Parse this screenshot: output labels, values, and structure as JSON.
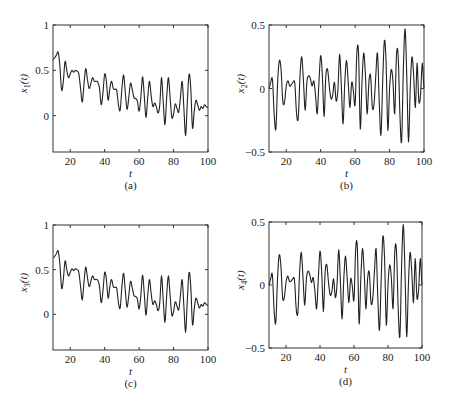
{
  "chart_data": [
    {
      "type": "line",
      "panel": "a",
      "caption": "(a)",
      "xlabel": "t",
      "ylabel": "x1(t)",
      "ylabel_main": "x",
      "ylabel_sub": "1",
      "ylabel_tail": "(t)",
      "xlim": [
        10,
        100
      ],
      "ylim": [
        -0.4,
        1
      ],
      "xticks": [
        20,
        40,
        60,
        80,
        100
      ],
      "yticks": [
        0,
        0.5,
        1
      ],
      "ytick_labels": [
        "0",
        "0.5",
        "1"
      ],
      "grid": false,
      "box": {
        "left": 53,
        "top": 25,
        "right": 208,
        "bottom": 152
      },
      "series": [
        {
          "name": "x1(t)",
          "x": [
            10,
            11,
            12,
            13,
            14,
            15,
            16,
            17,
            18,
            19,
            20,
            21,
            22,
            23,
            24,
            25,
            26,
            27,
            28,
            29,
            30,
            31,
            32,
            33,
            34,
            35,
            36,
            37,
            38,
            39,
            40,
            41,
            42,
            43,
            44,
            45,
            46,
            47,
            48,
            49,
            50,
            51,
            52,
            53,
            54,
            55,
            56,
            57,
            58,
            59,
            60,
            61,
            62,
            63,
            64,
            65,
            66,
            67,
            68,
            69,
            70,
            71,
            72,
            73,
            74,
            75,
            76,
            77,
            78,
            79,
            80,
            81,
            82,
            83,
            84,
            85,
            86,
            87,
            88,
            89,
            90,
            91,
            92,
            93,
            94,
            95,
            96,
            97,
            98,
            99,
            100
          ],
          "values": [
            0.62,
            0.64,
            0.67,
            0.7,
            0.55,
            0.28,
            0.38,
            0.6,
            0.5,
            0.42,
            0.46,
            0.5,
            0.48,
            0.5,
            0.49,
            0.46,
            0.3,
            0.15,
            0.35,
            0.52,
            0.4,
            0.3,
            0.36,
            0.42,
            0.38,
            0.38,
            0.37,
            0.3,
            0.12,
            0.25,
            0.46,
            0.38,
            0.17,
            0.3,
            0.38,
            0.3,
            0.29,
            0.28,
            0.12,
            0.06,
            0.3,
            0.45,
            0.25,
            0.07,
            0.2,
            0.36,
            0.29,
            0.2,
            0.19,
            0.16,
            0.05,
            0.2,
            0.43,
            0.22,
            -0.02,
            0.2,
            0.38,
            0.22,
            0.1,
            0.14,
            0.1,
            0.03,
            0.12,
            0.42,
            0.15,
            -0.1,
            0.2,
            0.42,
            0.2,
            -0.02,
            0.02,
            0.13,
            0.08,
            0.04,
            0.2,
            0.38,
            0.08,
            -0.22,
            0.15,
            0.46,
            0.3,
            -0.14,
            0.05,
            0.17,
            0.12,
            0.06,
            0.1,
            0.08,
            0.12,
            0.1,
            0.09
          ],
          "color": "#222222"
        }
      ]
    },
    {
      "type": "line",
      "panel": "b",
      "caption": "(b)",
      "xlabel": "t",
      "ylabel": "x2(t)",
      "ylabel_main": "x",
      "ylabel_sub": "2",
      "ylabel_tail": "(t)",
      "xlim": [
        10,
        100
      ],
      "ylim": [
        -0.5,
        0.5
      ],
      "xticks": [
        20,
        40,
        60,
        80,
        100
      ],
      "yticks": [
        -0.5,
        0,
        0.5
      ],
      "ytick_labels": [
        "−0.5",
        "0",
        "0.5"
      ],
      "grid": false,
      "box": {
        "left": 269,
        "top": 25,
        "right": 424,
        "bottom": 152
      },
      "series": [
        {
          "name": "x2(t)",
          "values": [
            0,
            0.05,
            0.07,
            -0.2,
            -0.32,
            0.05,
            0.22,
            0.15,
            -0.1,
            -0.11,
            0.02,
            0.06,
            0.02,
            0.03,
            0.05,
            0.04,
            -0.2,
            -0.23,
            0.1,
            0.25,
            0.06,
            -0.17,
            0.05,
            0.1,
            0.08,
            0.02,
            0.06,
            -0.05,
            -0.2,
            0.05,
            0.26,
            0.1,
            -0.22,
            0.1,
            0.15,
            0.02,
            -0.08,
            -0.05,
            0.05,
            -0.1,
            -0.01,
            0.27,
            0.02,
            -0.28,
            0.05,
            0.22,
            0.05,
            -0.15,
            0.05,
            -0.02,
            -0.13,
            0.28,
            0.28,
            -0.32,
            0.05,
            0.28,
            0.1,
            -0.2,
            0.05,
            0.1,
            -0.15,
            -0.12,
            0.1,
            0.28,
            -0.1,
            -0.37,
            0.05,
            0.38,
            0.2,
            -0.33,
            0.0,
            0.15,
            0.05,
            -0.2,
            0.26,
            0.26,
            -0.2,
            -0.42,
            0.15,
            0.47,
            0.1,
            -0.42,
            0.0,
            0.25,
            0.1,
            -0.15,
            0.2,
            -0.1,
            -0.05,
            0.2,
            0.0
          ],
          "color": "#222222"
        }
      ]
    },
    {
      "type": "line",
      "panel": "c",
      "caption": "(c)",
      "xlabel": "t",
      "ylabel": "x3(t)",
      "ylabel_main": "x",
      "ylabel_sub": "3",
      "ylabel_tail": "(t)",
      "xlim": [
        10,
        100
      ],
      "ylim": [
        -0.4,
        1
      ],
      "xticks": [
        20,
        40,
        60,
        80,
        100
      ],
      "yticks": [
        0,
        0.5,
        1
      ],
      "ytick_labels": [
        "0",
        "0.5",
        "1"
      ],
      "grid": false,
      "box": {
        "left": 53,
        "top": 225,
        "right": 208,
        "bottom": 350
      },
      "series": [
        {
          "name": "x3(t)",
          "values": [
            0.63,
            0.65,
            0.68,
            0.71,
            0.56,
            0.29,
            0.39,
            0.6,
            0.5,
            0.43,
            0.47,
            0.51,
            0.49,
            0.51,
            0.5,
            0.47,
            0.31,
            0.16,
            0.36,
            0.53,
            0.41,
            0.31,
            0.37,
            0.43,
            0.39,
            0.39,
            0.38,
            0.31,
            0.13,
            0.26,
            0.47,
            0.39,
            0.18,
            0.31,
            0.39,
            0.31,
            0.3,
            0.29,
            0.13,
            0.07,
            0.31,
            0.46,
            0.26,
            0.08,
            0.21,
            0.37,
            0.3,
            0.21,
            0.2,
            0.17,
            0.06,
            0.21,
            0.44,
            0.23,
            -0.01,
            0.21,
            0.39,
            0.23,
            0.11,
            0.15,
            0.11,
            0.04,
            0.13,
            0.43,
            0.16,
            -0.09,
            0.21,
            0.43,
            0.21,
            -0.01,
            0.03,
            0.14,
            0.09,
            0.05,
            0.21,
            0.39,
            0.09,
            -0.2,
            0.16,
            0.47,
            0.31,
            -0.12,
            0.06,
            0.18,
            0.13,
            0.07,
            0.11,
            0.09,
            0.13,
            0.11,
            0.1
          ],
          "color": "#222222"
        }
      ]
    },
    {
      "type": "line",
      "panel": "d",
      "caption": "(d)",
      "xlabel": "t",
      "ylabel": "x4(t)",
      "ylabel_main": "x",
      "ylabel_sub": "4",
      "ylabel_tail": "(t)",
      "xlim": [
        10,
        100
      ],
      "ylim": [
        -0.5,
        0.5
      ],
      "xticks": [
        20,
        40,
        60,
        80,
        100
      ],
      "yticks": [
        -0.5,
        0,
        0.5
      ],
      "ytick_labels": [
        "−0.5",
        "0",
        "0.5"
      ],
      "grid": false,
      "box": {
        "left": 269,
        "top": 222,
        "right": 422,
        "bottom": 348
      },
      "series": [
        {
          "name": "x4(t)",
          "values": [
            0,
            0.05,
            0.08,
            -0.2,
            -0.3,
            0.05,
            0.24,
            0.15,
            -0.1,
            -0.1,
            0.02,
            0.07,
            0.03,
            0.03,
            0.05,
            0.04,
            -0.19,
            -0.22,
            0.1,
            0.26,
            0.06,
            -0.16,
            0.05,
            0.11,
            0.08,
            0.02,
            0.06,
            -0.05,
            -0.19,
            0.05,
            0.27,
            0.1,
            -0.21,
            0.1,
            0.16,
            0.02,
            -0.08,
            -0.05,
            0.05,
            -0.1,
            0.0,
            0.28,
            0.03,
            -0.27,
            0.05,
            0.23,
            0.05,
            -0.14,
            0.05,
            -0.01,
            -0.12,
            0.29,
            0.29,
            -0.31,
            0.05,
            0.29,
            0.1,
            -0.19,
            0.05,
            0.1,
            -0.14,
            -0.11,
            0.1,
            0.29,
            -0.1,
            -0.36,
            0.05,
            0.39,
            0.2,
            -0.32,
            0.0,
            0.16,
            0.05,
            -0.19,
            0.27,
            0.27,
            -0.19,
            -0.41,
            0.15,
            0.48,
            0.1,
            -0.41,
            0.0,
            0.26,
            0.1,
            -0.14,
            0.21,
            -0.1,
            -0.04,
            0.21,
            0.0
          ],
          "color": "#222222"
        }
      ]
    }
  ]
}
